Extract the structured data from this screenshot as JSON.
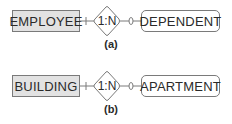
{
  "diagrams": [
    {
      "id": "a",
      "owner_entity": "EMPLOYEE",
      "relationship_cardinality": "1:N",
      "dependent_entity": "DEPENDENT",
      "caption": "(a)"
    },
    {
      "id": "b",
      "owner_entity": "BUILDING",
      "relationship_cardinality": "1:N",
      "dependent_entity": "APARTMENT",
      "caption": "(b)"
    }
  ],
  "colors": {
    "strong_entity_fill": "#e2e2e2",
    "border": "#7a7a7a",
    "text": "#2a2a2a"
  }
}
